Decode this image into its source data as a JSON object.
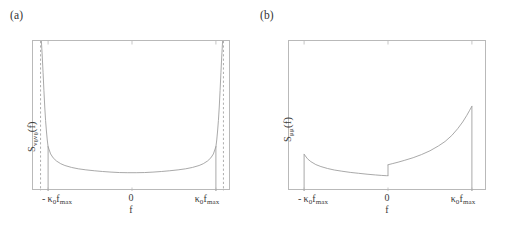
{
  "figure": {
    "width": 512,
    "height": 228,
    "background": "#ffffff",
    "line_color": "#9a9a9a",
    "frame_color": "#b9b9b9",
    "text_color": "#3a3a3a"
  },
  "panels": [
    {
      "id": "a",
      "label": "(a)",
      "ylabel_main": "S",
      "ylabel_sub": "v",
      "ylabel_sub2": "0",
      "ylabel_sub_b": "v",
      "ylabel_sub2_b": "0",
      "ylabel_tail": "(f)",
      "ylabel_plain": "S_{v0 v0}(f)",
      "xlabel": "f",
      "ticks": {
        "neg_prefix": "-",
        "neg_kappa": "κ",
        "neg_kappa_sub": "0",
        "neg_f": "f",
        "neg_f_sub": "max",
        "zero": "0",
        "pos_kappa": "κ",
        "pos_kappa_sub": "0",
        "pos_f": "f",
        "pos_f_sub": "max"
      },
      "has_asymptotes": true
    },
    {
      "id": "b",
      "label": "(b)",
      "ylabel_main": "S",
      "ylabel_sub": "μμ",
      "ylabel_tail": "(f)",
      "ylabel_plain": "S_{μμ}(f)",
      "xlabel": "f",
      "ticks": {
        "neg_prefix": "-",
        "neg_kappa": "κ",
        "neg_kappa_sub": "0",
        "neg_f": "f",
        "neg_f_sub": "max",
        "zero": "0",
        "pos_kappa": "κ",
        "pos_kappa_sub": "0",
        "pos_f": "f",
        "pos_f_sub": "max"
      },
      "has_asymptotes": false
    }
  ],
  "chart_data": [
    {
      "type": "line",
      "panel": "a",
      "title": "(a)",
      "xlabel": "f",
      "ylabel": "S_{v0 v0}(f)",
      "xlim": [
        -1.18,
        1.18
      ],
      "ylim": [
        0,
        1.0
      ],
      "xticks": [
        -1,
        0,
        1
      ],
      "xticklabels": [
        "- κ₀f_max",
        "0",
        "κ₀f_max"
      ],
      "grid": false,
      "legend": null,
      "description": "Symmetric U-shaped spectral density diverging at f = ±κ₀f_max; dashed vertical asymptote lines drawn just outside the solid support edges.",
      "series": [
        {
          "name": "S_v0v0 solid support branch",
          "style": "solid",
          "x": [
            -1.0,
            -0.97,
            -0.94,
            -0.9,
            -0.85,
            -0.8,
            -0.72,
            -0.64,
            -0.55,
            -0.45,
            -0.35,
            -0.25,
            -0.15,
            -0.05,
            0.0,
            0.05,
            0.15,
            0.25,
            0.35,
            0.45,
            0.55,
            0.64,
            0.72,
            0.8,
            0.85,
            0.9,
            0.94,
            0.97,
            1.0
          ],
          "y": [
            0.295,
            0.247,
            0.221,
            0.2,
            0.182,
            0.17,
            0.157,
            0.148,
            0.141,
            0.135,
            0.13,
            0.126,
            0.123,
            0.122,
            0.122,
            0.122,
            0.123,
            0.126,
            0.13,
            0.135,
            0.141,
            0.148,
            0.157,
            0.17,
            0.182,
            0.2,
            0.221,
            0.247,
            0.295
          ]
        },
        {
          "name": "S_v0v0 divergent tail left",
          "style": "solid",
          "x": [
            -1.0,
            -1.01,
            -1.02,
            -1.03,
            -1.04,
            -1.05,
            -1.06,
            -1.07,
            -1.08
          ],
          "y": [
            0.295,
            0.34,
            0.4,
            0.47,
            0.56,
            0.67,
            0.79,
            0.9,
            1.0
          ]
        },
        {
          "name": "S_v0v0 divergent tail right",
          "style": "solid",
          "x": [
            1.0,
            1.01,
            1.02,
            1.03,
            1.04,
            1.05,
            1.06,
            1.07,
            1.08
          ],
          "y": [
            0.295,
            0.34,
            0.4,
            0.47,
            0.56,
            0.67,
            0.79,
            0.9,
            1.0
          ]
        }
      ],
      "vertical_drop_lines": [
        {
          "x": -1.0,
          "y_from": 0.0,
          "y_to": 0.295,
          "style": "solid"
        },
        {
          "x": 1.0,
          "y_from": 0.0,
          "y_to": 0.295,
          "style": "solid"
        }
      ],
      "asymptotes": [
        {
          "x": -1.09,
          "style": "dashed"
        },
        {
          "x": 1.09,
          "style": "dashed"
        }
      ]
    },
    {
      "type": "line",
      "panel": "b",
      "title": "(b)",
      "xlabel": "f",
      "ylabel": "S_{μμ}(f)",
      "xlim": [
        -1.18,
        1.18
      ],
      "ylim": [
        0,
        1.0
      ],
      "xticks": [
        -1,
        0,
        1
      ],
      "xticklabels": [
        "- κ₀f_max",
        "0",
        "κ₀f_max"
      ],
      "grid": false,
      "legend": null,
      "description": "Asymmetric spectral density with a jump discontinuity at f = 0; left branch decays from a finite value at -κ₀f_max, right branch rises to a finite peak at +κ₀f_max then drops to zero.",
      "series": [
        {
          "name": "S_mumu left branch",
          "style": "solid",
          "x": [
            -1.0,
            -0.96,
            -0.92,
            -0.86,
            -0.8,
            -0.72,
            -0.64,
            -0.55,
            -0.45,
            -0.35,
            -0.25,
            -0.15,
            -0.08,
            -0.02,
            0.0
          ],
          "y": [
            0.245,
            0.215,
            0.196,
            0.176,
            0.163,
            0.15,
            0.14,
            0.132,
            0.124,
            0.118,
            0.112,
            0.107,
            0.104,
            0.102,
            0.102
          ]
        },
        {
          "name": "S_mumu right branch",
          "style": "solid",
          "x": [
            0.0,
            0.05,
            0.12,
            0.2,
            0.3,
            0.4,
            0.5,
            0.6,
            0.68,
            0.76,
            0.83,
            0.89,
            0.94,
            0.97,
            1.0
          ],
          "y": [
            0.175,
            0.182,
            0.192,
            0.205,
            0.222,
            0.243,
            0.268,
            0.3,
            0.33,
            0.37,
            0.415,
            0.46,
            0.505,
            0.535,
            0.565
          ]
        }
      ],
      "vertical_drop_lines": [
        {
          "x": -1.0,
          "y_from": 0.0,
          "y_to": 0.245,
          "style": "solid"
        },
        {
          "x": 0.0,
          "y_from": 0.102,
          "y_to": 0.175,
          "style": "solid"
        },
        {
          "x": 1.0,
          "y_from": 0.0,
          "y_to": 0.565,
          "style": "solid"
        }
      ],
      "asymptotes": []
    }
  ]
}
